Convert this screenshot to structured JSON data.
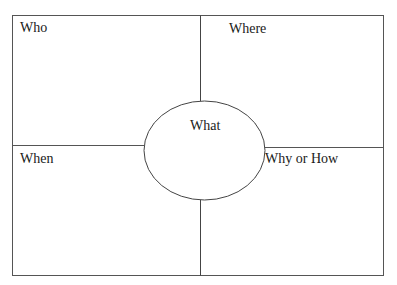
{
  "diagram": {
    "type": "5W graphic organizer",
    "quadrants": {
      "top_left": "Who",
      "top_right": "Where",
      "bottom_left": "When",
      "bottom_right": "Why or How"
    },
    "center": "What"
  },
  "colors": {
    "line": "#555555",
    "text": "#1a1a1a",
    "background": "#ffffff"
  }
}
